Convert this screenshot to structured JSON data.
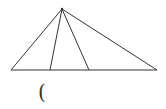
{
  "diagram": {
    "type": "geometry-triangle",
    "apex": {
      "x": 62,
      "y": 9
    },
    "base_left": {
      "x": 11,
      "y": 70
    },
    "base_right": {
      "x": 157,
      "y": 70
    },
    "cevian_feet": [
      {
        "x": 50,
        "y": 70
      },
      {
        "x": 89,
        "y": 70
      }
    ],
    "stroke_color": "#333333"
  },
  "caption": {
    "text": "("
  }
}
